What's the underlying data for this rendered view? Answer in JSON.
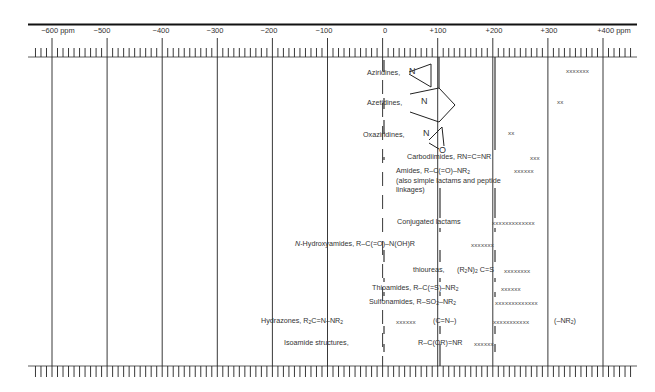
{
  "chart_data": {
    "type": "diagram",
    "axis": {
      "unit": "ppm",
      "min": -600,
      "max": 400,
      "tick_labels": [
        "-600 ppm",
        "-500",
        "-400",
        "-300",
        "-200",
        "-100",
        "0",
        "+100",
        "+200",
        "+300",
        "+400 ppm"
      ],
      "tick_values": [
        -600,
        -500,
        -400,
        -300,
        -200,
        -100,
        0,
        100,
        200,
        300,
        400
      ],
      "minor_tick_step": 10
    },
    "entries": [
      {
        "name": "Aziridines, N",
        "marks": "xxxxxxx",
        "range_ppm": [
          330,
          375
        ]
      },
      {
        "name": "Azetidines, N",
        "marks": "xx",
        "range_ppm": [
          330,
          340
        ]
      },
      {
        "name": "Oxaziridines, N/O",
        "marks": "xx",
        "range_ppm": [
          225,
          235
        ]
      },
      {
        "name": "Carbodiimides, RN=C=NR",
        "marks": "xxx",
        "range_ppm": [
          265,
          280
        ]
      },
      {
        "name": "Amides, R-C(=O)-NR2 (also simple lactams and peptide linkages)",
        "marks": "xxxxxx",
        "range_ppm": [
          245,
          275
        ]
      },
      {
        "name": "Conjugated lactams",
        "marks": "xxxxxxxxxxxxx",
        "range_ppm": [
          200,
          260
        ]
      },
      {
        "name": "N-Hydroxyamides, R-C(=O)-N(OH)R",
        "marks": "xxxxxxx",
        "range_ppm": [
          175,
          210
        ]
      },
      {
        "name": "thioureas, (R2N)2C=S",
        "marks": "xxxxxxxx",
        "range_ppm": [
          210,
          250
        ]
      },
      {
        "name": "Thioamides, R-C(=S)-NR2",
        "marks": "xxxxxx",
        "range_ppm": [
          220,
          250
        ]
      },
      {
        "name": "Sulfonamides, R-SO2-NR2",
        "marks": "xxxxxxxxxxxxx",
        "range_ppm": [
          200,
          260
        ]
      },
      {
        "name": "Hydrazones, R2C=N-NR2 (C=N-)",
        "marks": "xxxxxx",
        "range_ppm": [
          25,
          55
        ]
      },
      {
        "name": "Hydrazones, R2C=N-NR2 (-NR2)",
        "marks": "xxxxxxxxxxx",
        "range_ppm": [
          195,
          250
        ]
      },
      {
        "name": "Isoamide structures, R-C(OR)=NR",
        "marks": "xxxxxx",
        "range_ppm": [
          160,
          190
        ]
      }
    ]
  },
  "scale": {
    "labels": [
      "−600 ppm",
      "−500",
      "−400",
      "−300",
      "−200",
      "−100",
      "0",
      "+100",
      "+200",
      "+300",
      "+400 ppm"
    ]
  },
  "entries": {
    "aziridines": {
      "label": "Aziridines,",
      "n": "N",
      "marks": "xxxxxxx"
    },
    "azetidines": {
      "label": "Azetidines,",
      "n": "N",
      "marks": "xx"
    },
    "oxaziridines": {
      "label": "Oxaziridines,",
      "n": "N",
      "o": "O",
      "marks": "xx"
    },
    "carbodiimides": {
      "label": "Carbodiimides, RN=C=NR",
      "marks": "xxx"
    },
    "amides": {
      "label_a": "Amides, R–C(=O)–NR",
      "sub": "2",
      "line2": "(also simple lactams and peptide",
      "line3": "linkages)",
      "marks": "xxxxxx"
    },
    "conjugated_lactams": {
      "label": "Conjugated lactams",
      "marks": "xxxxxxxxxxxxx"
    },
    "hydroxyamides": {
      "italic": "N",
      "label": "-Hydroxyamides, R–C(=O)–N(OH)R",
      "marks": "xxxxxxx"
    },
    "thioureas": {
      "label": "thioureas,",
      "formula_a": "(R",
      "sub": "2",
      "formula_b": "N)",
      "sub2": "2",
      "formula_c": "C=S",
      "marks": "xxxxxxxx"
    },
    "thioamides": {
      "label_a": "Thioamides, R–C(=S)–NR",
      "sub": "2",
      "marks": "xxxxxx"
    },
    "sulfonamides": {
      "label_a": "Sulfonamides, R–SO",
      "sub": "2",
      "label_b": "–NR",
      "sub2": "2",
      "marks": "xxxxxxxxxxxxx"
    },
    "hydrazones": {
      "label_a": "Hydrazones, R",
      "sub": "2",
      "label_b": "C=N–NR",
      "sub2": "2",
      "marks_cn": "xxxxxx",
      "cn": "(C=N–)",
      "marks_nr2": "xxxxxxxxxxx",
      "nr2_a": "(–NR",
      "nr2_sub": "2",
      "nr2_b": ")"
    },
    "isoamides": {
      "label": "Isoamide structures,",
      "formula": "R–C(OR)=NR",
      "marks": "xxxxxx"
    }
  }
}
